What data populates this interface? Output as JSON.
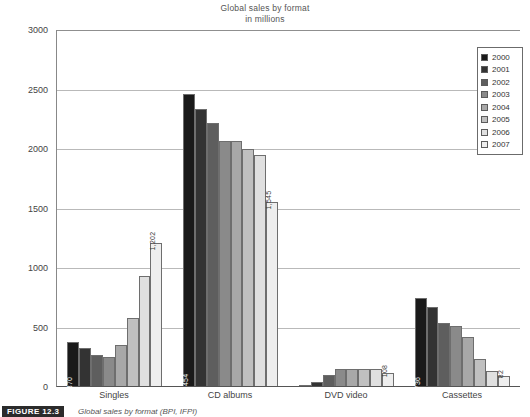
{
  "chart_data": {
    "type": "bar",
    "title": "Global sales  by format",
    "subtitle": "in millions",
    "xlabel": "",
    "ylabel": "",
    "ylim": [
      0,
      3000
    ],
    "yticks": [
      0,
      500,
      1000,
      1500,
      2000,
      2500,
      3000
    ],
    "ytick_labels": [
      "0",
      "500",
      "1000",
      "1500",
      "2000",
      "2500",
      "3000"
    ],
    "grid": true,
    "legend_position": "top-right",
    "categories": [
      "Singles",
      "CD albums",
      "DVD video",
      "Cassettes"
    ],
    "series": [
      {
        "name": "2000",
        "color": "#1a1a1a",
        "values": [
          370,
          2454,
          5,
          736
        ]
      },
      {
        "name": "2001",
        "color": "#333333",
        "values": [
          320,
          2330,
          30,
          664
        ]
      },
      {
        "name": "2002",
        "color": "#5e5e5e",
        "values": [
          258,
          2214,
          95,
          528
        ]
      },
      {
        "name": "2003",
        "color": "#8a8a8a",
        "values": [
          240,
          2062,
          140,
          506
        ]
      },
      {
        "name": "2004",
        "color": "#a8a8a8",
        "values": [
          345,
          2058,
          142,
          412
        ]
      },
      {
        "name": "2005",
        "color": "#c0c0c0",
        "values": [
          570,
          1988,
          140,
          224
        ]
      },
      {
        "name": "2006",
        "color": "#e0e0e0",
        "values": [
          925,
          1938,
          142,
          130
        ]
      },
      {
        "name": "2007",
        "color": "#eeeeee",
        "values": [
          1202,
          1545,
          108,
          82
        ]
      }
    ],
    "data_labels": [
      {
        "category": "Singles",
        "series": "2000",
        "text": "370",
        "placement": "inside"
      },
      {
        "category": "Singles",
        "series": "2007",
        "text": "1,202",
        "placement": "above"
      },
      {
        "category": "CD albums",
        "series": "2000",
        "text": "2,454",
        "placement": "inside"
      },
      {
        "category": "CD albums",
        "series": "2007",
        "text": "1,545",
        "placement": "above"
      },
      {
        "category": "DVD video",
        "series": "2007",
        "text": "108",
        "placement": "above"
      },
      {
        "category": "Cassettes",
        "series": "2000",
        "text": "736",
        "placement": "inside"
      },
      {
        "category": "Cassettes",
        "series": "2007",
        "text": "82",
        "placement": "above"
      }
    ]
  },
  "legend": {
    "items": [
      {
        "label": "2000"
      },
      {
        "label": "2001"
      },
      {
        "label": "2002"
      },
      {
        "label": "2003"
      },
      {
        "label": "2004"
      },
      {
        "label": "2005"
      },
      {
        "label": "2006"
      },
      {
        "label": "2007"
      }
    ]
  },
  "caption": {
    "tag": "FIGURE 12.3",
    "text": "Global sales by format (BPI, IFPI)"
  }
}
